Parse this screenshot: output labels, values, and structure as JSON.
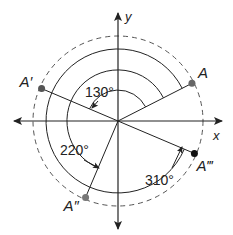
{
  "diagram": {
    "axes": {
      "x_label": "x",
      "y_label": "y"
    },
    "points": [
      {
        "name": "A",
        "label": "A",
        "angle_deg": 27,
        "fill": "#666666"
      },
      {
        "name": "A-prime",
        "label": "A′",
        "angle_deg": 157,
        "fill": "#555555"
      },
      {
        "name": "A-double-prime",
        "label": "A″",
        "angle_deg": 247,
        "fill": "#777777"
      },
      {
        "name": "A-triple-prime",
        "label": "A‴",
        "angle_deg": 337,
        "fill": "#111111"
      }
    ],
    "rotations": [
      {
        "label": "130°",
        "degrees": 130
      },
      {
        "label": "220°",
        "degrees": 220
      },
      {
        "label": "310°",
        "degrees": 310
      }
    ],
    "colors": {
      "line": "#222222",
      "dashed_circle": "#555555"
    }
  }
}
